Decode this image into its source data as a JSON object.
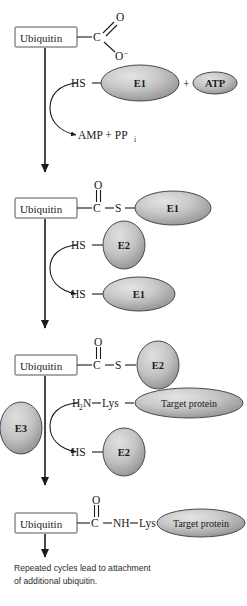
{
  "figure": {
    "background_color": "#ffffff",
    "ellipse_fill_light": "#d9d9d9",
    "ellipse_fill_dark": "#9b9b9b",
    "ellipse_stroke": "#4a4a4a",
    "line_color": "#1a1a1a"
  },
  "labels": {
    "ubiquitin": "Ubiquitin",
    "e1": "E1",
    "e2": "E2",
    "e3": "E3",
    "atp": "ATP",
    "target_protein": "Target protein",
    "hs": "HS",
    "c": "C",
    "s": "S",
    "o": "O",
    "o_minus": "O",
    "o_minus_charge": "–",
    "nh": "NH",
    "lys": "Lys",
    "h2n": "H",
    "h2n_sub": "2",
    "h2n_rest": "N",
    "plus": "+",
    "amp": "AMP  +  PP",
    "amp_sub": "i"
  },
  "steps": [
    {
      "id": "step1-activation",
      "ubiquitin": "Ubiquitin",
      "group": "carboxylate",
      "reactants": [
        "HS",
        "E1",
        "ATP"
      ],
      "products": [
        "AMP + PPi"
      ]
    },
    {
      "id": "step2-e1-thioester",
      "ubiquitin": "Ubiquitin",
      "linkage": "C(=O)—S",
      "partner": "E1",
      "reactants": [
        "HS",
        "E2"
      ],
      "products": [
        "HS",
        "E1"
      ]
    },
    {
      "id": "step3-e2-thioester",
      "ubiquitin": "Ubiquitin",
      "linkage": "C(=O)—S",
      "partner": "E2",
      "reactants": [
        "H2N—Lys",
        "Target protein"
      ],
      "products": [
        "HS",
        "E2"
      ],
      "enzyme": "E3"
    },
    {
      "id": "step4-isopeptide",
      "ubiquitin": "Ubiquitin",
      "linkage": "C(=O)—NH—Lys",
      "partner": "Target protein"
    }
  ],
  "caption": {
    "text": "Repeated cycles lead to attachment of additional ubiquitin."
  }
}
